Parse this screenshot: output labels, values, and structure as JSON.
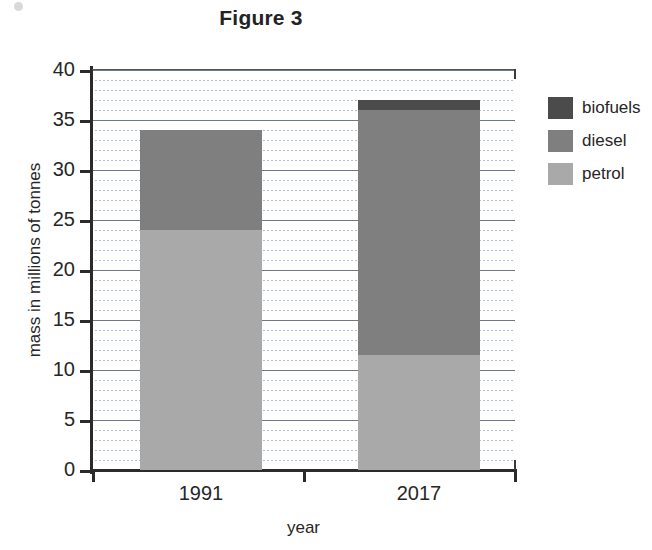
{
  "chart_data": {
    "type": "bar",
    "subtype": "stacked-vertical",
    "title": "Figure 3",
    "xlabel": "year",
    "ylabel": "mass in millions of tonnes",
    "categories": [
      "1991",
      "2017"
    ],
    "series": [
      {
        "name": "petrol",
        "color": "#a9a9a9",
        "values": [
          24,
          11.5
        ]
      },
      {
        "name": "diesel",
        "color": "#7f7f7f",
        "values": [
          10,
          24.5
        ]
      },
      {
        "name": "biofuels",
        "color": "#4b4b4b",
        "values": [
          0,
          1
        ]
      }
    ],
    "totals": [
      34,
      37
    ],
    "ylim": [
      0,
      40
    ],
    "ytick_step": 5,
    "yticks": [
      40,
      35,
      30,
      25,
      20,
      15,
      10,
      5,
      0
    ],
    "ytick_labels": [
      "40",
      "35",
      "30",
      "25",
      "20",
      "15",
      "10",
      "5",
      "0"
    ],
    "minor_gridline_step": 1,
    "grid": true,
    "legend_position": "right",
    "legend_order": [
      "biofuels",
      "diesel",
      "petrol"
    ]
  },
  "legend": {
    "items": [
      {
        "label": "biofuels",
        "color": "#4b4b4b"
      },
      {
        "label": "diesel",
        "color": "#7f7f7f"
      },
      {
        "label": "petrol",
        "color": "#a9a9a9"
      }
    ]
  }
}
